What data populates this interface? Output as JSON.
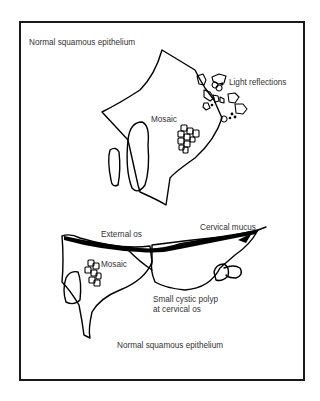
{
  "figure": {
    "upper_view": {
      "labels": {
        "normal_epithelium": "Normal squamous epithelium",
        "light_reflections": "Light reflections",
        "mosaic": "Mosaic"
      }
    },
    "lower_view": {
      "labels": {
        "cervical_mucus": "Cervical mucus",
        "external_os": "External os",
        "mosaic": "Mosaic",
        "polyp_line1": "Small cystic polyp",
        "polyp_line2": "at cervical os",
        "normal_epithelium": "Normal squamous epithelium"
      }
    }
  },
  "colors": {
    "line": "#000000",
    "text": "#333333",
    "frame": "#1a1a1a",
    "background": "#ffffff"
  }
}
